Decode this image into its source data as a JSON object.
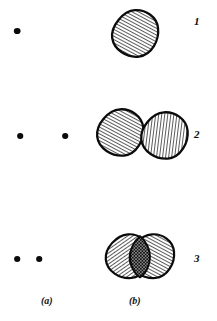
{
  "figure": {
    "title": "",
    "background_color": "#ffffff",
    "ink_color": "#0b0b0b",
    "width": 217,
    "height": 321,
    "columns": [
      {
        "id": "a",
        "label": "(a)",
        "label_x": 41,
        "label_y": 296,
        "description": "point pattern"
      },
      {
        "id": "b",
        "label": "(b)",
        "label_x": 129,
        "label_y": 296,
        "description": "hatched disc pattern"
      }
    ],
    "rows": [
      {
        "number": "1",
        "number_x": 194,
        "number_y": 16,
        "points": [
          {
            "cx": 17,
            "cy": 31,
            "r": 3.2
          }
        ],
        "discs": [
          {
            "cx": 135,
            "cy": 33,
            "r": 23,
            "hatch": "forward",
            "hatch_angle_deg": 62,
            "hatch_spacing": 3.0
          }
        ],
        "overlap": false
      },
      {
        "number": "2",
        "number_x": 194,
        "number_y": 129,
        "points": [
          {
            "cx": 20,
            "cy": 136,
            "r": 3.0
          },
          {
            "cx": 65,
            "cy": 136,
            "r": 3.0
          }
        ],
        "discs": [
          {
            "cx": 120,
            "cy": 132,
            "r": 23,
            "hatch": "forward",
            "hatch_angle_deg": 60,
            "hatch_spacing": 3.0
          },
          {
            "cx": 164,
            "cy": 135,
            "r": 23,
            "hatch": "backward",
            "hatch_angle_deg": 83,
            "hatch_spacing": 3.0
          }
        ],
        "overlap": false
      },
      {
        "number": "3",
        "number_x": 194,
        "number_y": 253,
        "points": [
          {
            "cx": 17,
            "cy": 259,
            "r": 3.0
          },
          {
            "cx": 39,
            "cy": 259,
            "r": 3.0
          }
        ],
        "discs": [
          {
            "cx": 128,
            "cy": 256,
            "r": 22,
            "hatch": "backward",
            "hatch_angle_deg": 125,
            "hatch_spacing": 3.0
          },
          {
            "cx": 152,
            "cy": 256,
            "r": 22,
            "hatch": "forward",
            "hatch_angle_deg": 62,
            "hatch_spacing": 3.0
          }
        ],
        "overlap": true,
        "overlap_fill": "cross-hatch"
      }
    ]
  }
}
